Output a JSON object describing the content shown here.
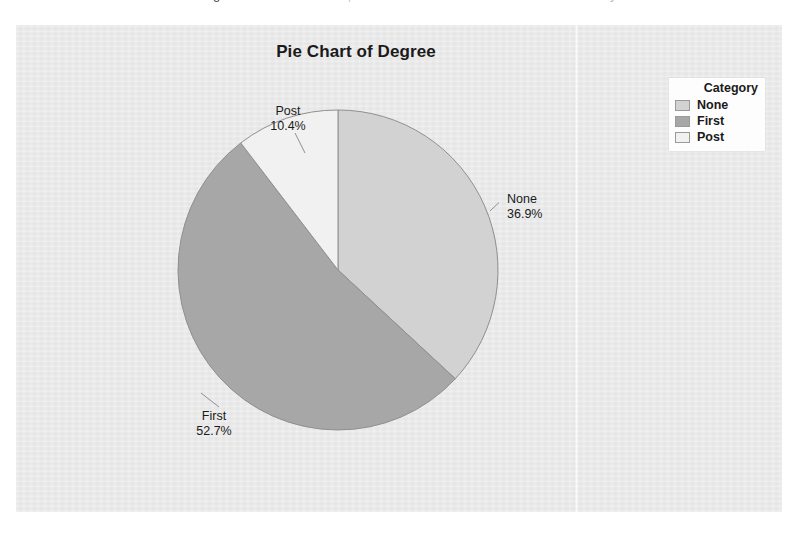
{
  "page": {
    "cutoff_text_fragments": [
      "g",
      "p",
      "y"
    ],
    "background_color": "#ffffff"
  },
  "chart_panel": {
    "background_color": "#e9e9e9"
  },
  "chart_data": {
    "type": "pie",
    "title": "Pie Chart of Degree",
    "xlabel": "",
    "ylabel": "",
    "categories": [
      "None",
      "First",
      "Post"
    ],
    "values": [
      36.9,
      52.7,
      10.4
    ],
    "value_unit": "percent",
    "labels": [
      {
        "name": "None",
        "percent": "36.9%"
      },
      {
        "name": "First",
        "percent": "52.7%"
      },
      {
        "name": "Post",
        "percent": "10.4%"
      }
    ],
    "colors": [
      "#d2d2d2",
      "#a7a7a7",
      "#f1f1f1"
    ],
    "slice_border_color": "#8f8f8f",
    "start_angle_oclock": 12,
    "direction": "clockwise",
    "grid": false,
    "legend_position": "right",
    "legend": {
      "title": "Category",
      "entries": [
        {
          "label": "None",
          "color": "#d2d2d2"
        },
        {
          "label": "First",
          "color": "#a7a7a7"
        },
        {
          "label": "Post",
          "color": "#f1f1f1"
        }
      ]
    }
  }
}
